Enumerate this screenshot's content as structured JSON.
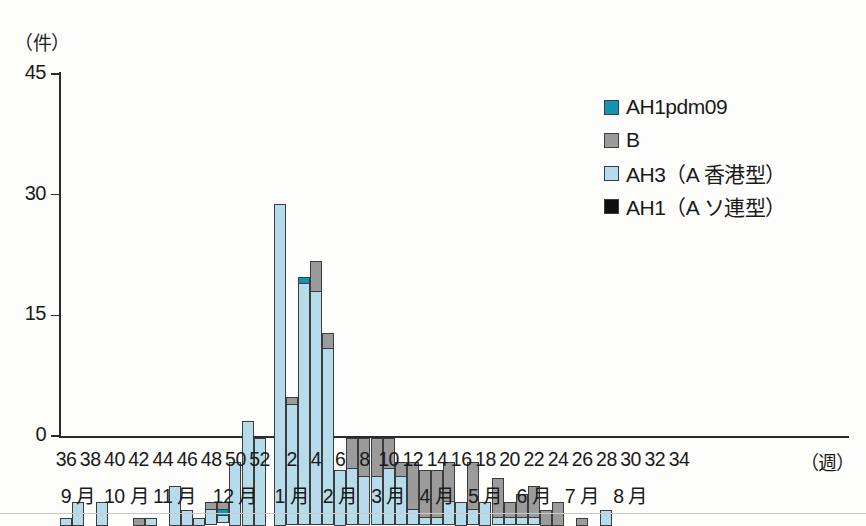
{
  "chart_data": {
    "type": "bar",
    "stacked": true,
    "title": "",
    "ylabel": "(件)",
    "xlabel": "(週)",
    "ylim": [
      0,
      45
    ],
    "yticks": [
      0,
      15,
      30,
      45
    ],
    "grid": false,
    "legend_position": "top-right",
    "axis_unit_y": "（件）",
    "axis_unit_x": "（週）",
    "series": [
      {
        "name": "AH1pdm09",
        "key": "pdm",
        "color": "#1394b0"
      },
      {
        "name": "B",
        "key": "b",
        "color": "#9b9b9b"
      },
      {
        "name": "AH3（A 香港型）",
        "key": "ah3",
        "color": "#b6dcec"
      },
      {
        "name": "AH1（A ソ連型）",
        "key": "ah1",
        "color": "#101010"
      }
    ],
    "week_ticks": [
      "36",
      "38",
      "40",
      "42",
      "44",
      "46",
      "48",
      "50",
      "52",
      "2",
      "4",
      "6",
      "8",
      "10",
      "12",
      "14",
      "16",
      "18",
      "20",
      "22",
      "24",
      "26",
      "28",
      "30",
      "32",
      "34"
    ],
    "month_ticks": [
      "9 月",
      "10 月",
      "11 月",
      "12 月",
      "1 月",
      "2 月",
      "3 月",
      "4 月",
      "5 月",
      "6 月",
      "7 月",
      "8 月"
    ],
    "categories": [
      "36",
      "37",
      "38",
      "39",
      "40",
      "41",
      "42",
      "43",
      "44",
      "45",
      "46",
      "47",
      "48",
      "49",
      "50",
      "51",
      "52",
      "1",
      "2",
      "3",
      "4",
      "5",
      "6",
      "7",
      "8",
      "9",
      "10",
      "11",
      "12",
      "13",
      "14",
      "15",
      "16",
      "17",
      "18",
      "19",
      "20",
      "21",
      "22",
      "23",
      "24",
      "25",
      "26",
      "27",
      "28",
      "29",
      "30",
      "31",
      "32",
      "33",
      "34"
    ],
    "points": [
      {
        "week": "36",
        "ah3": 1,
        "b": 0,
        "pdm": 0,
        "ah1": 0
      },
      {
        "week": "37",
        "ah3": 3,
        "b": 0,
        "pdm": 0,
        "ah1": 0
      },
      {
        "week": "38",
        "ah3": 0,
        "b": 0,
        "pdm": 0,
        "ah1": 0
      },
      {
        "week": "39",
        "ah3": 3,
        "b": 0,
        "pdm": 0,
        "ah1": 0
      },
      {
        "week": "40",
        "ah3": 0,
        "b": 0,
        "pdm": 0,
        "ah1": 0
      },
      {
        "week": "41",
        "ah3": 0,
        "b": 0,
        "pdm": 0,
        "ah1": 0
      },
      {
        "week": "42",
        "ah3": 0,
        "b": 1,
        "pdm": 0,
        "ah1": 0
      },
      {
        "week": "43",
        "ah3": 1,
        "b": 0,
        "pdm": 0,
        "ah1": 0
      },
      {
        "week": "44",
        "ah3": 0,
        "b": 0,
        "pdm": 0,
        "ah1": 0
      },
      {
        "week": "45",
        "ah3": 5,
        "b": 0,
        "pdm": 0,
        "ah1": 0
      },
      {
        "week": "46",
        "ah3": 2,
        "b": 0,
        "pdm": 0,
        "ah1": 0
      },
      {
        "week": "47",
        "ah3": 1,
        "b": 0,
        "pdm": 0,
        "ah1": 0
      },
      {
        "week": "48",
        "ah3": 2,
        "b": 1,
        "pdm": 0,
        "ah1": 0
      },
      {
        "week": "49",
        "ah3": 1,
        "b": 1,
        "pdm": 1,
        "ah1": 0
      },
      {
        "week": "50",
        "ah3": 8,
        "b": 0,
        "pdm": 0,
        "ah1": 0
      },
      {
        "week": "51",
        "ah3": 13,
        "b": 0,
        "pdm": 0,
        "ah1": 0
      },
      {
        "week": "52",
        "ah3": 11,
        "b": 0,
        "pdm": 0,
        "ah1": 0
      },
      {
        "week": "1",
        "ah3": 40,
        "b": 0,
        "pdm": 0,
        "ah1": 0
      },
      {
        "week": "2",
        "ah3": 15,
        "b": 1,
        "pdm": 0,
        "ah1": 0
      },
      {
        "week": "3",
        "ah3": 30,
        "b": 0,
        "pdm": 1,
        "ah1": 0
      },
      {
        "week": "4",
        "ah3": 29,
        "b": 4,
        "pdm": 0,
        "ah1": 0
      },
      {
        "week": "5",
        "ah3": 22,
        "b": 2,
        "pdm": 0,
        "ah1": 0
      },
      {
        "week": "6",
        "ah3": 7,
        "b": 0,
        "pdm": 0,
        "ah1": 0
      },
      {
        "week": "7",
        "ah3": 7,
        "b": 4,
        "pdm": 0,
        "ah1": 0
      },
      {
        "week": "8",
        "ah3": 6,
        "b": 5,
        "pdm": 0,
        "ah1": 0
      },
      {
        "week": "9",
        "ah3": 6,
        "b": 5,
        "pdm": 0,
        "ah1": 0
      },
      {
        "week": "10",
        "ah3": 7,
        "b": 4,
        "pdm": 0,
        "ah1": 0
      },
      {
        "week": "11",
        "ah3": 6,
        "b": 2,
        "pdm": 0,
        "ah1": 0
      },
      {
        "week": "12",
        "ah3": 2,
        "b": 6,
        "pdm": 0,
        "ah1": 0
      },
      {
        "week": "13",
        "ah3": 1,
        "b": 6,
        "pdm": 0,
        "ah1": 0
      },
      {
        "week": "14",
        "ah3": 1,
        "b": 6,
        "pdm": 0,
        "ah1": 0
      },
      {
        "week": "15",
        "ah3": 3,
        "b": 5,
        "pdm": 0,
        "ah1": 0
      },
      {
        "week": "16",
        "ah3": 3,
        "b": 0,
        "pdm": 0,
        "ah1": 0
      },
      {
        "week": "17",
        "ah3": 2,
        "b": 6,
        "pdm": 0,
        "ah1": 0
      },
      {
        "week": "18",
        "ah3": 3,
        "b": 0,
        "pdm": 0,
        "ah1": 0
      },
      {
        "week": "19",
        "ah3": 1,
        "b": 5,
        "pdm": 0,
        "ah1": 0
      },
      {
        "week": "20",
        "ah3": 1,
        "b": 2,
        "pdm": 0,
        "ah1": 0
      },
      {
        "week": "21",
        "ah3": 1,
        "b": 3,
        "pdm": 0,
        "ah1": 0
      },
      {
        "week": "22",
        "ah3": 1,
        "b": 4,
        "pdm": 0,
        "ah1": 0
      },
      {
        "week": "23",
        "ah3": 0,
        "b": 2,
        "pdm": 0,
        "ah1": 0
      },
      {
        "week": "24",
        "ah3": 0,
        "b": 3,
        "pdm": 0,
        "ah1": 0
      },
      {
        "week": "25",
        "ah3": 0,
        "b": 0,
        "pdm": 0,
        "ah1": 0
      },
      {
        "week": "26",
        "ah3": 0,
        "b": 1,
        "pdm": 0,
        "ah1": 0
      },
      {
        "week": "27",
        "ah3": 0,
        "b": 0,
        "pdm": 0,
        "ah1": 0
      },
      {
        "week": "28",
        "ah3": 2,
        "b": 0,
        "pdm": 0,
        "ah1": 0
      },
      {
        "week": "29",
        "ah3": 0,
        "b": 0,
        "pdm": 0,
        "ah1": 0
      },
      {
        "week": "30",
        "ah3": 0,
        "b": 0,
        "pdm": 0,
        "ah1": 0
      },
      {
        "week": "31",
        "ah3": 0,
        "b": 0,
        "pdm": 0,
        "ah1": 0
      },
      {
        "week": "32",
        "ah3": 0,
        "b": 0,
        "pdm": 0,
        "ah1": 0
      },
      {
        "week": "33",
        "ah3": 0,
        "b": 0,
        "pdm": 0,
        "ah1": 0
      },
      {
        "week": "34",
        "ah3": 0,
        "b": 0,
        "pdm": 0,
        "ah1": 0
      }
    ]
  }
}
